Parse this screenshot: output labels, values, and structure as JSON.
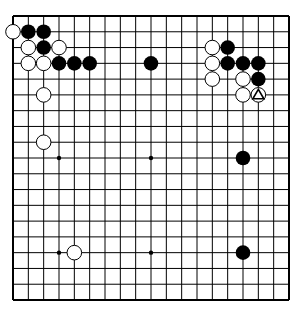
{
  "board": {
    "size": 19,
    "origin": [
      13,
      16
    ],
    "end": [
      289,
      300
    ],
    "line_color": "#000000",
    "background": "#ffffff",
    "star_points": [
      [
        3,
        9
      ],
      [
        9,
        9
      ],
      [
        3,
        15
      ],
      [
        9,
        15
      ]
    ],
    "stones": [
      {
        "color": "white",
        "col": 0,
        "row": 1
      },
      {
        "color": "black",
        "col": 1,
        "row": 1
      },
      {
        "color": "black",
        "col": 2,
        "row": 1
      },
      {
        "color": "white",
        "col": 1,
        "row": 2
      },
      {
        "color": "black",
        "col": 2,
        "row": 2
      },
      {
        "color": "white",
        "col": 3,
        "row": 2
      },
      {
        "color": "white",
        "col": 1,
        "row": 3
      },
      {
        "color": "white",
        "col": 2,
        "row": 3
      },
      {
        "color": "black",
        "col": 3,
        "row": 3
      },
      {
        "color": "black",
        "col": 4,
        "row": 3
      },
      {
        "color": "black",
        "col": 5,
        "row": 3
      },
      {
        "color": "black",
        "col": 9,
        "row": 3
      },
      {
        "color": "white",
        "col": 2,
        "row": 5
      },
      {
        "color": "white",
        "col": 2,
        "row": 8
      },
      {
        "color": "white",
        "col": 13,
        "row": 2
      },
      {
        "color": "black",
        "col": 14,
        "row": 2
      },
      {
        "color": "white",
        "col": 13,
        "row": 3
      },
      {
        "color": "black",
        "col": 14,
        "row": 3
      },
      {
        "color": "black",
        "col": 15,
        "row": 3
      },
      {
        "color": "black",
        "col": 16,
        "row": 3
      },
      {
        "color": "white",
        "col": 13,
        "row": 4
      },
      {
        "color": "white",
        "col": 15,
        "row": 4
      },
      {
        "color": "black",
        "col": 16,
        "row": 4
      },
      {
        "color": "white",
        "col": 15,
        "row": 5
      },
      {
        "color": "white",
        "col": 16,
        "row": 5,
        "marker": "triangle"
      },
      {
        "color": "black",
        "col": 15,
        "row": 9
      },
      {
        "color": "white",
        "col": 4,
        "row": 15
      },
      {
        "color": "black",
        "col": 15,
        "row": 15
      }
    ]
  }
}
